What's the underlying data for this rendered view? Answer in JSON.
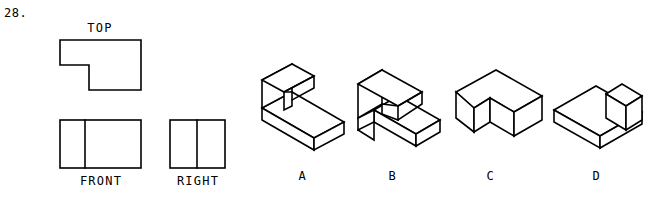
{
  "question": {
    "number": "28."
  },
  "orthographic": {
    "top": {
      "label": "TOP",
      "shape": "l-shape-notch-bottom-right"
    },
    "front": {
      "label": "FRONT",
      "shape": "rectangle-with-vertical-divider"
    },
    "right": {
      "label": "RIGHT",
      "shape": "rectangle-with-vertical-divider"
    }
  },
  "options": [
    {
      "label": "A",
      "description": "l-block-vertical-wall-back-left-with-base-slab"
    },
    {
      "label": "B",
      "description": "l-block-with-notch-cut-lower-left-front"
    },
    {
      "label": "C",
      "description": "l-shaped-upright-walls-corner"
    },
    {
      "label": "D",
      "description": "flat-l-base-slab-with-upright-block-right"
    }
  ],
  "colors": {
    "ink": "#000000",
    "paper": "#ffffff"
  }
}
